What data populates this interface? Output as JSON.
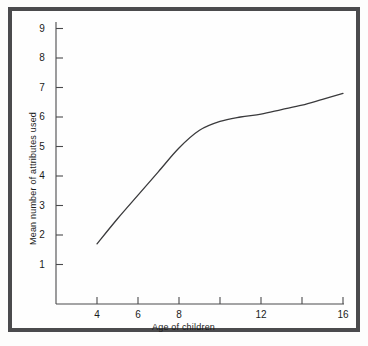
{
  "figure": {
    "background_color": "#fefefe",
    "frame_color": "#4b4b4d",
    "line_color": "#3a3a3c"
  },
  "chart_data": {
    "type": "line",
    "title": "",
    "xlabel": "Age of children",
    "ylabel": "Mean number of attributes used",
    "xlim": [
      3,
      16
    ],
    "ylim": [
      0,
      9
    ],
    "grid": false,
    "legend": null,
    "xticks": [
      4,
      6,
      8,
      10,
      12,
      14,
      16
    ],
    "xtick_labels": [
      "4",
      "6",
      "8",
      "",
      "12",
      "",
      "16"
    ],
    "yticks": [
      1,
      2,
      3,
      4,
      5,
      6,
      7,
      8,
      9
    ],
    "ytick_labels": [
      "1",
      "2",
      "3",
      "4",
      "5",
      "6",
      "7",
      "8",
      "9"
    ],
    "x": [
      4,
      5,
      6,
      7,
      8,
      9,
      10,
      11,
      12,
      13,
      14,
      15,
      16
    ],
    "values": [
      1.7,
      2.55,
      3.35,
      4.15,
      4.95,
      5.55,
      5.85,
      6.0,
      6.1,
      6.25,
      6.4,
      6.6,
      6.8
    ],
    "series": [
      {
        "name": "Mean number of attributes used",
        "values": [
          1.7,
          2.55,
          3.35,
          4.15,
          4.95,
          5.55,
          5.85,
          6.0,
          6.1,
          6.25,
          6.4,
          6.6,
          6.8
        ]
      }
    ]
  }
}
